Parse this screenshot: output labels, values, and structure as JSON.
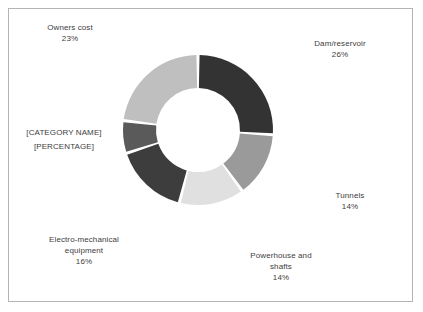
{
  "chart_data": {
    "type": "pie",
    "subtype": "doughnut",
    "title": "",
    "subtitle": "",
    "xlabel": "",
    "ylabel": "",
    "legend_position": "none",
    "grid": false,
    "label_format": "category name and percentage outside slices",
    "hole_ratio": 0.56,
    "start_angle_deg": 0,
    "direction": "clockwise",
    "categories": [
      "Dam/reservoir",
      "Tunnels",
      "Powerhouse and shafts",
      "Electro-mechanical equipment",
      "[CATEGORY NAME]",
      "Owners cost"
    ],
    "values": [
      26,
      14,
      14,
      16,
      7,
      23
    ],
    "percent_labels": [
      "26%",
      "14%",
      "14%",
      "16%",
      "[PERCENTAGE]",
      "23%"
    ],
    "colors": [
      "#333333",
      "#9a9a9a",
      "#e0e0e0",
      "#3d3d3d",
      "#5a5a5a",
      "#bfbfbf"
    ],
    "slice_gap_color": "#ffffff"
  },
  "slices": [
    {
      "name": "dam-reservoir",
      "label": "Dam/reservoir",
      "percent": "26%",
      "value": 26,
      "color": "#333333"
    },
    {
      "name": "tunnels",
      "label": "Tunnels",
      "percent": "14%",
      "value": 14,
      "color": "#9a9a9a"
    },
    {
      "name": "powerhouse-and-shafts",
      "label_line1": "Powerhouse and",
      "label_line2": "shafts",
      "percent": "14%",
      "value": 14,
      "color": "#e0e0e0"
    },
    {
      "name": "electro-mechanical-equipment",
      "label_line1": "Electro-mechanical",
      "label_line2": "equipment",
      "percent": "16%",
      "value": 16,
      "color": "#3d3d3d"
    },
    {
      "name": "unnamed-placeholder",
      "label": "[CATEGORY NAME]",
      "percent": "[PERCENTAGE]",
      "value": 7,
      "color": "#5a5a5a"
    },
    {
      "name": "owners-cost",
      "label": "Owners cost",
      "percent": "23%",
      "value": 23,
      "color": "#bfbfbf"
    }
  ],
  "frame": {
    "border_color": "#b4b4b4",
    "background": "#ffffff"
  },
  "text": {
    "color": "#404040"
  }
}
